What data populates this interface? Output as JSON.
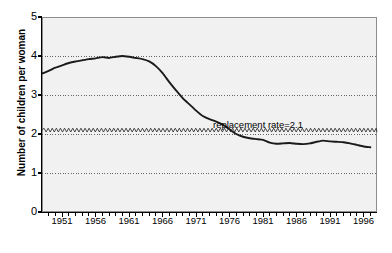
{
  "chart_data": {
    "type": "line",
    "title": "",
    "xlabel": "",
    "ylabel": "Number of children per woman",
    "xlim": [
      1948,
      1998
    ],
    "ylim": [
      0,
      5
    ],
    "grid": true,
    "gridlines_y": [
      1,
      2,
      3,
      4
    ],
    "yticks": [
      "0",
      "1",
      "2",
      "3",
      "4",
      "5"
    ],
    "xticks": [
      "1951",
      "1956",
      "1961",
      "1966",
      "1971",
      "1976",
      "1981",
      "1986",
      "1991",
      "1996"
    ],
    "xtick_minor_step": 1,
    "legend_position": "none",
    "annotations": [
      {
        "text": "replacement rate=2.1",
        "x": 1979,
        "y": 2.45
      }
    ],
    "reference_lines": [
      {
        "label": "replacement rate",
        "value": 2.1,
        "style": "zigzag"
      }
    ],
    "series": [
      {
        "name": "Total fertility rate",
        "x": [
          1948,
          1949,
          1950,
          1951,
          1952,
          1953,
          1954,
          1955,
          1956,
          1957,
          1958,
          1959,
          1960,
          1961,
          1962,
          1963,
          1964,
          1965,
          1966,
          1967,
          1968,
          1969,
          1970,
          1971,
          1972,
          1973,
          1974,
          1975,
          1976,
          1977,
          1978,
          1979,
          1980,
          1981,
          1982,
          1983,
          1984,
          1985,
          1986,
          1987,
          1988,
          1989,
          1990,
          1991,
          1992,
          1993,
          1994,
          1995,
          1996,
          1997
        ],
        "values": [
          3.55,
          3.62,
          3.7,
          3.76,
          3.82,
          3.86,
          3.89,
          3.92,
          3.94,
          3.97,
          3.95,
          3.98,
          4.0,
          3.98,
          3.95,
          3.92,
          3.86,
          3.74,
          3.56,
          3.33,
          3.12,
          2.92,
          2.76,
          2.6,
          2.46,
          2.38,
          2.32,
          2.24,
          2.12,
          2.0,
          1.93,
          1.89,
          1.87,
          1.85,
          1.78,
          1.75,
          1.76,
          1.77,
          1.75,
          1.74,
          1.76,
          1.8,
          1.83,
          1.81,
          1.8,
          1.79,
          1.76,
          1.72,
          1.68,
          1.66
        ]
      }
    ],
    "colors": {
      "line": "#1a1a1a",
      "plot_background": "#f1f1f1",
      "plot_border": "#8d8d8d",
      "gridline": "#555555",
      "page_background": "#ffffff"
    }
  }
}
